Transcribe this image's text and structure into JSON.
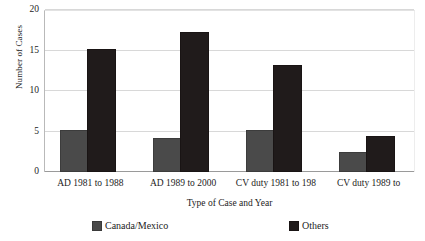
{
  "chart_data": {
    "type": "bar",
    "title": "",
    "xlabel": "Type of Case and Year",
    "ylabel": "Number of Cases",
    "categories": [
      "AD 1981 to 1988",
      "AD 1989 to 2000",
      "CV duty 1981 to 198",
      "CV duty 1989 to"
    ],
    "series": [
      {
        "name": "Canada/Mexico",
        "color": "#4a4a4a",
        "values": [
          5,
          4,
          5,
          2.2
        ]
      },
      {
        "name": "Others",
        "color": "#201b1b",
        "values": [
          15,
          17,
          13,
          4.2
        ]
      }
    ],
    "ylim": [
      0,
      20
    ],
    "yticks": [
      0,
      5,
      10,
      15,
      20
    ],
    "ytick_labels": [
      "0",
      "5",
      "10",
      "15",
      "20"
    ],
    "grid": "horizontal",
    "legend_position": "bottom"
  }
}
